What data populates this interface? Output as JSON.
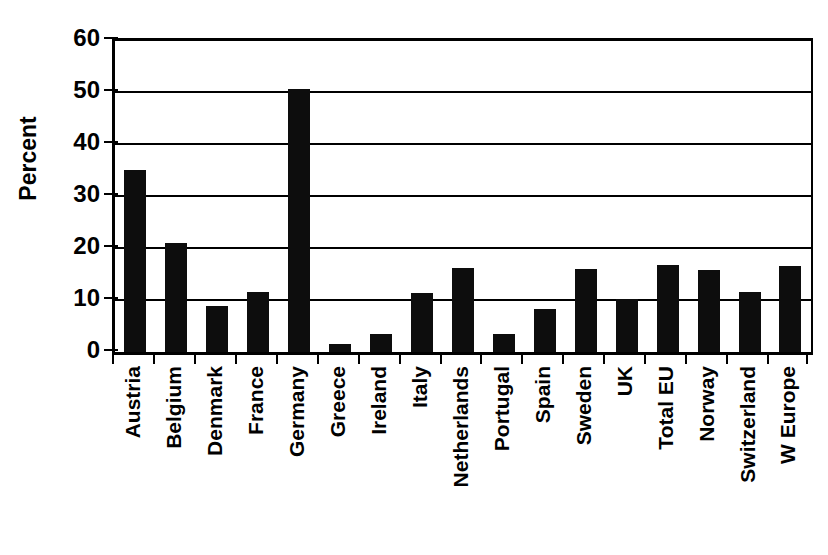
{
  "chart_data": {
    "type": "bar",
    "title": "",
    "xlabel": "",
    "ylabel": "Percent",
    "ylim": [
      0,
      60
    ],
    "yticks": [
      0,
      10,
      20,
      30,
      40,
      50,
      60
    ],
    "grid": true,
    "legend": "none",
    "bar_color": "#0d0d0d",
    "categories": [
      "Austria",
      "Belgium",
      "Denmark",
      "France",
      "Germany",
      "Greece",
      "Ireland",
      "Italy",
      "Netherlands",
      "Portugal",
      "Spain",
      "Sweden",
      "UK",
      "Total EU",
      "Norway",
      "Switzerland",
      "W Europe"
    ],
    "values": [
      35.0,
      20.9,
      8.9,
      11.6,
      50.6,
      1.6,
      3.5,
      11.4,
      16.2,
      3.4,
      8.2,
      16.0,
      10.1,
      16.8,
      15.8,
      11.6,
      16.6
    ]
  }
}
